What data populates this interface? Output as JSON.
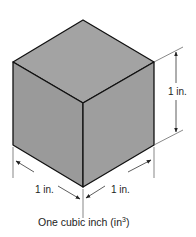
{
  "diagram": {
    "type": "isometric-cube-dimensioned",
    "colors": {
      "face": "#9e9e9e",
      "edge": "#111111",
      "dimension_line": "#444444",
      "background": "#ffffff"
    },
    "dimensions": {
      "height_label": "1 in.",
      "left_width_label": "1 in.",
      "right_depth_label": "1 in."
    },
    "caption": {
      "text": "One cubic inch (in",
      "superscript": "3",
      "suffix": ")"
    }
  }
}
